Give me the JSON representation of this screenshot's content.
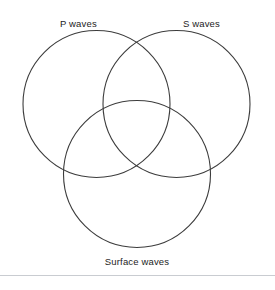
{
  "figure": {
    "type": "venn-diagram-3-set",
    "background_color": "#ffffff",
    "stroke_color": "#3c3c3c",
    "text_color": "#1d1d1d",
    "divider_color": "#c9ccd1"
  },
  "labels": {
    "set_a": "P waves",
    "set_b": "S waves",
    "set_c": "Surface waves"
  },
  "circles": [
    {
      "name": "p-waves-circle",
      "cx": 96.5,
      "cy": 104,
      "r": 73.5
    },
    {
      "name": "s-waves-circle",
      "cx": 176.5,
      "cy": 104,
      "r": 73.5
    },
    {
      "name": "surface-waves-circle",
      "cx": 137,
      "cy": 174,
      "r": 73.5
    }
  ],
  "regions": {
    "a_only": "",
    "b_only": "",
    "c_only": "",
    "ab": "",
    "ac": "",
    "bc": "",
    "abc": ""
  }
}
